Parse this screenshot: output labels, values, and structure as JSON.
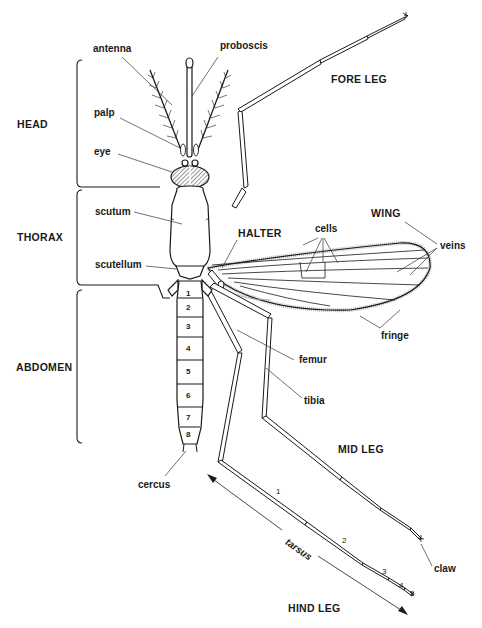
{
  "diagram": {
    "regions": {
      "head": "HEAD",
      "thorax": "THORAX",
      "abdomen": "ABDOMEN"
    },
    "head_parts": {
      "antenna": "antenna",
      "proboscis": "proboscis",
      "palp": "palp",
      "eye": "eye"
    },
    "thorax_parts": {
      "scutum": "scutum",
      "scutellum": "scutellum",
      "halter": "HALTER"
    },
    "wing": {
      "title": "WING",
      "cells": "cells",
      "veins": "veins",
      "fringe": "fringe"
    },
    "legs": {
      "fore_leg": "FORE LEG",
      "mid_leg": "MID LEG",
      "hind_leg": "HIND LEG",
      "femur": "femur",
      "tibia": "tibia",
      "tarsus": "tarsus",
      "claw": "claw",
      "tarsal_segments": [
        "1",
        "2",
        "3",
        "4",
        "5"
      ]
    },
    "abdomen": {
      "segments": [
        "1",
        "2",
        "3",
        "4",
        "5",
        "6",
        "7",
        "8"
      ],
      "cercus": "cercus"
    }
  }
}
